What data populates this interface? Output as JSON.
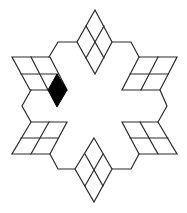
{
  "diagram": {
    "title": "",
    "colors": {
      "background": "#ffffff",
      "line": "#2a2a2a",
      "highlight": "#000000"
    },
    "shapes": {
      "top_rhombus": {
        "outline": "95,10 112,42 95,74 77,42",
        "grid": [
          "86,26 104,58",
          "104,26 86,58"
        ]
      },
      "bottom_rhombus": {
        "outline": "94,138 112,169 94,202 75,169",
        "grid": [
          "85,154 103,186",
          "103,154 85,186"
        ]
      },
      "upper_left_parallelogram": {
        "outline": "12,57 50,57 67,90 30,90",
        "grid": [
          "21,74 58,74",
          "31,57 48,90"
        ]
      },
      "upper_right_parallelogram": {
        "outline": "139,57 177,57 160,90 122,90",
        "grid": [
          "130,74 168,74",
          "158,57 141,90"
        ]
      },
      "lower_left_parallelogram": {
        "outline": "31,122 67,122 50,154 12,154",
        "grid": [
          "21,138 58,138",
          "49,122 31,154"
        ]
      },
      "lower_right_parallelogram": {
        "outline": "122,122 158,122 177,154 139,154",
        "grid": [
          "130,138 168,138",
          "140,122 158,154"
        ]
      },
      "highlighted_rhombus": {
        "outline": "57,74 67,90 57,107 48,90",
        "color": "black"
      }
    },
    "connectors": [
      "49,57 58,42 77,42",
      "112,42 131,42 139,57",
      "160,90 167,106 158,122",
      "139,154 131,169 112,169",
      "75,169 58,169 50,154",
      "31,122 22,106 31,90"
    ]
  }
}
